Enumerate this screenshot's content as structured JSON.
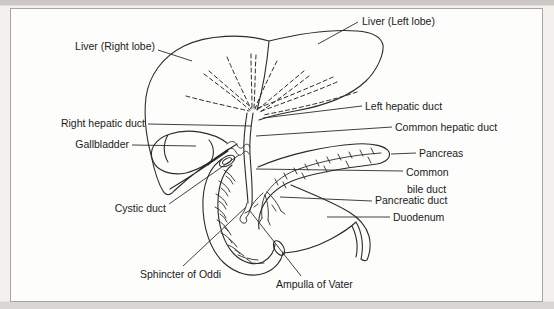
{
  "figure": {
    "type": "anatomical-line-diagram",
    "colors": {
      "ink": "#2b2b2b",
      "paper": "#fdfdfb",
      "page_tint": "#f2f1ee",
      "border": "#a6a5a0",
      "scan_band_top": "#cbc8c3",
      "scan_band_bottom": "#d9d7d3"
    },
    "labels": [
      {
        "id": "liver-right-lobe",
        "text": "Liver (Right lobe)"
      },
      {
        "id": "liver-left-lobe",
        "text": "Liver (Left lobe)"
      },
      {
        "id": "right-hepatic-duct",
        "text": "Right hepatic duct"
      },
      {
        "id": "gallbladder",
        "text": "Gallbladder"
      },
      {
        "id": "cystic-duct",
        "text": "Cystic duct"
      },
      {
        "id": "sphincter-of-oddi",
        "text": "Sphincter of Oddi"
      },
      {
        "id": "ampulla-of-vater",
        "text": "Ampulla of Vater"
      },
      {
        "id": "left-hepatic-duct",
        "text": "Left hepatic duct"
      },
      {
        "id": "common-hepatic-duct",
        "text": "Common hepatic duct"
      },
      {
        "id": "pancreas",
        "text": "Pancreas"
      },
      {
        "id": "common-bile-duct",
        "text": "Common bile duct",
        "line1": "Common",
        "line2": "bile duct"
      },
      {
        "id": "pancreatic-duct",
        "text": "Pancreatic duct"
      },
      {
        "id": "duodenum",
        "text": "Duodenum"
      }
    ]
  }
}
